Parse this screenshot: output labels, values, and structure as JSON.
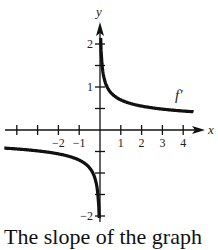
{
  "chart_data": {
    "type": "line",
    "title": "",
    "xlabel": "x",
    "ylabel": "y",
    "series": [
      {
        "name": "f'",
        "label": "f′",
        "formula_approx": "0.7*sign(x)*|x|^(-1/3)",
        "points": [
          [
            -4.5,
            -0.42
          ],
          [
            -4,
            -0.44
          ],
          [
            -3,
            -0.49
          ],
          [
            -2,
            -0.56
          ],
          [
            -1,
            -0.7
          ],
          [
            -0.5,
            -0.88
          ],
          [
            -0.25,
            -1.11
          ],
          [
            -0.1,
            -1.51
          ],
          [
            -0.04,
            -2.05
          ],
          [
            0.04,
            2.05
          ],
          [
            0.1,
            1.51
          ],
          [
            0.25,
            1.11
          ],
          [
            0.5,
            0.88
          ],
          [
            1,
            0.7
          ],
          [
            2,
            0.56
          ],
          [
            3,
            0.49
          ],
          [
            4,
            0.44
          ],
          [
            4.5,
            0.42
          ]
        ]
      }
    ],
    "x_ticks": [
      -4,
      -3,
      -2,
      -1,
      1,
      2,
      3,
      4
    ],
    "x_tick_labels": [
      "-2",
      "-1",
      "1",
      "2",
      "3",
      "4"
    ],
    "y_ticks": [
      -2,
      -1.5,
      -1,
      -0.5,
      0.5,
      1,
      1.5,
      2
    ],
    "y_tick_labels": [
      "2",
      "1",
      "-2"
    ],
    "xlim": [
      -4.7,
      4.7
    ],
    "ylim": [
      -2.2,
      2.3
    ],
    "grid": false,
    "legend": "curve label f′ near x=4"
  },
  "labels": {
    "x_axis": "x",
    "y_axis": "y",
    "curve": "f′",
    "caption": "The slope of the graph"
  }
}
